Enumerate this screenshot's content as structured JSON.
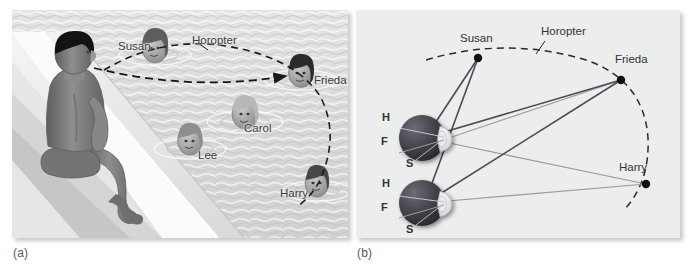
{
  "figure": {
    "kind": "textbook-illustration",
    "captions": {
      "panel_a": "(a)",
      "panel_b": "(b)"
    }
  },
  "panel_a": {
    "scene": "swimming-pool-scene",
    "description": "A boy sits on the edge of a swimming pool fixating on Frieda; four swimmers' heads appear in the water.",
    "labels": [
      {
        "id": "susan",
        "text": "Susan",
        "x": 106,
        "y": 36
      },
      {
        "id": "horopter",
        "text": "Horopter",
        "x": 180,
        "y": 32
      },
      {
        "id": "frieda",
        "text": "Frieda",
        "x": 302,
        "y": 71
      },
      {
        "id": "carol",
        "text": "Carol",
        "x": 232,
        "y": 118
      },
      {
        "id": "lee",
        "text": "Lee",
        "x": 186,
        "y": 145
      },
      {
        "id": "harry",
        "text": "Harry",
        "x": 274,
        "y": 183
      }
    ],
    "swimmers": [
      {
        "id": "susan",
        "cx": 143,
        "cy": 38,
        "hair": "#5e5e5e"
      },
      {
        "id": "frieda",
        "cx": 289,
        "cy": 63,
        "hair": "#2b2b2b"
      },
      {
        "id": "carol",
        "cx": 233,
        "cy": 104,
        "hair": "#b8b8b8"
      },
      {
        "id": "lee",
        "cx": 178,
        "cy": 131,
        "hair": "#8e8e8e"
      },
      {
        "id": "harry",
        "cx": 305,
        "cy": 173,
        "hair": "#474747"
      }
    ],
    "gaze_line": "dashed arrow from observer's eye to Frieda",
    "horopter_curve": "dashed arc through Susan, Frieda and Harry"
  },
  "panel_b": {
    "scene": "geometric-horopter-diagram",
    "description": "Top view: two eyes with retinal points H, F and S; rays to Susan, Frieda and Harry.",
    "points": [
      {
        "id": "susan",
        "label": "Susan",
        "x": 478,
        "y": 58,
        "label_x": 462,
        "label_y": 34
      },
      {
        "id": "frieda",
        "label": "Frieda",
        "x": 621,
        "y": 80,
        "label_x": 617,
        "label_y": 55
      },
      {
        "id": "harry",
        "label": "Harry",
        "x": 646,
        "y": 184,
        "label_x": 623,
        "label_y": 163
      }
    ],
    "horopter": {
      "label": "Horopter",
      "label_x": 541,
      "label_y": 28
    },
    "eyes": [
      {
        "id": "upper-eye",
        "cx": 422,
        "cy": 138,
        "r": 23,
        "retina_labels": [
          {
            "id": "h",
            "text": "H",
            "x": 382,
            "y": 118
          },
          {
            "id": "f",
            "text": "F",
            "x": 381,
            "y": 142
          },
          {
            "id": "s",
            "text": "S",
            "x": 406,
            "y": 163
          }
        ]
      },
      {
        "id": "lower-eye",
        "cx": 422,
        "cy": 203,
        "r": 23,
        "retina_labels": [
          {
            "id": "h",
            "text": "H",
            "x": 382,
            "y": 186
          },
          {
            "id": "f",
            "text": "F",
            "x": 381,
            "y": 210
          },
          {
            "id": "s",
            "text": "S",
            "x": 406,
            "y": 231
          }
        ]
      }
    ],
    "ray_colors": {
      "near_dark": "#4a4a55",
      "far_gray": "#9a9a9a"
    },
    "background": "#eceded"
  }
}
